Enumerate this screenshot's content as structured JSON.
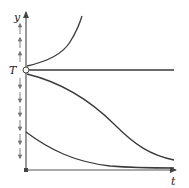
{
  "diagram": {
    "type": "phase-line-solution-curves",
    "colors": {
      "curve": "#3a3a3a",
      "axis": "#555555",
      "arrow": "#777777",
      "background": "#ffffff"
    },
    "axes": {
      "x_label": "t",
      "y_label": "y"
    },
    "equilibrium": {
      "label": "T",
      "type": "unstable-semistable-open-circle"
    },
    "phase_arrows": {
      "above_equilibrium": "up",
      "below_equilibrium": "down",
      "up_count": 3,
      "down_count": 6
    },
    "curves": [
      {
        "name": "above-equilibrium-growth",
        "description": "starts just above T, increases rapidly"
      },
      {
        "name": "equilibrium-constant",
        "description": "horizontal line y = T"
      },
      {
        "name": "below-equilibrium-sigmoid-decrease",
        "description": "starts just below T, decreases toward t-axis"
      },
      {
        "name": "low-initial-decay",
        "description": "starts lower, decays toward t-axis"
      }
    ]
  }
}
